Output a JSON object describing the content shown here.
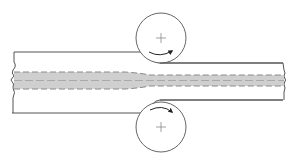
{
  "diagram": {
    "type": "flat-rolling-process",
    "colors": {
      "outline": "#555555",
      "roll_outline": "#666666",
      "band_fill": "#cfcfcf",
      "band_dash": "#8a8a8a",
      "arrow": "#222222",
      "background": "#ffffff"
    },
    "strip": {
      "entry_top": 52,
      "entry_bottom": 113,
      "exit_top": 63,
      "exit_bottom": 100,
      "left_x": 13,
      "right_x": 286,
      "gap_x": 148
    },
    "rolls": [
      {
        "name": "top-roll",
        "cx": 161,
        "cy": 38,
        "r": 25,
        "rotation": "clockwise"
      },
      {
        "name": "bottom-roll",
        "cx": 161,
        "cy": 127,
        "r": 25,
        "rotation": "counter-clockwise"
      }
    ]
  }
}
